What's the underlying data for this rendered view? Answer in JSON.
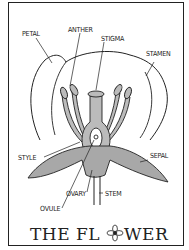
{
  "title": {
    "before": "THE FL",
    "after": "WER",
    "flower_glyph": "flower-icon"
  },
  "labels": {
    "petal": "PETAL",
    "anther": "ANTHER",
    "stigma": "STIGMA",
    "stamen": "STAMEN",
    "style": "STYLE",
    "sepal": "SEPAL",
    "ovary": "OVARY",
    "stem": "STEM",
    "ovule": "OVULE"
  },
  "colors": {
    "ink": "#222222",
    "shade": "#a8a8a8",
    "paper": "#ffffff"
  }
}
